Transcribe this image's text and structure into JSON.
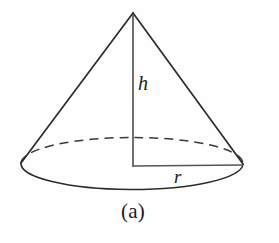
{
  "figure": {
    "kind": "geometry-diagram",
    "caption": "(a)",
    "background_color": "#fefefe",
    "stroke_color": "#2b2b2b",
    "labels": {
      "height": "h",
      "radius": "r"
    },
    "geometry": {
      "apex": {
        "x": 133,
        "y": 13
      },
      "base_center": {
        "x": 132,
        "y": 166
      },
      "base_radius_x": 111,
      "base_radius_y": 26,
      "left_tangent": {
        "x": 21,
        "y": 163
      },
      "right_tangent": {
        "x": 243,
        "y": 164
      },
      "height_line": {
        "x1": 133,
        "y1": 14,
        "x2": 133,
        "y2": 167
      },
      "radius_line": {
        "x1": 133,
        "y1": 166,
        "x2": 243,
        "y2": 165
      },
      "front_arc_style": "solid",
      "back_arc_style": "dashed",
      "dash_pattern": "9 6",
      "stroke_width": 1.6
    }
  }
}
